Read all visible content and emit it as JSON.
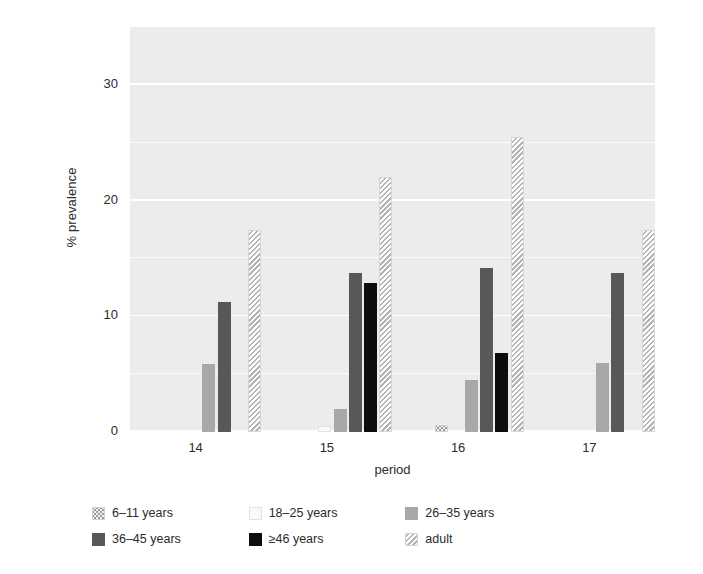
{
  "chart_data": {
    "type": "bar",
    "title": "",
    "xlabel": "period",
    "ylabel": "% prevalence",
    "categories": [
      "14",
      "15",
      "16",
      "17"
    ],
    "xtick_labels": [
      "14",
      "15",
      "16",
      "17"
    ],
    "ytick_labels": [
      "0",
      "10",
      "20",
      "30"
    ],
    "ytick_values": [
      0,
      10,
      20,
      30
    ],
    "yminor_values": [
      5,
      15,
      25
    ],
    "ylim": [
      0,
      35
    ],
    "grid": "horizontal-white-on-gray",
    "legend_position": "below-axis",
    "panel_background": "#ececec",
    "gridline_color": "#ffffff",
    "series": [
      {
        "name": "6–11 years",
        "fill": "dotted",
        "color": "#f2f2f2",
        "values": [
          0,
          0,
          0.6,
          0
        ]
      },
      {
        "name": "18–25 years",
        "fill": "very-light-solid",
        "color": "#fafafa",
        "values": [
          0,
          0.5,
          0,
          0
        ]
      },
      {
        "name": "26–35 years",
        "fill": "solid",
        "color": "#a8a8a8",
        "values": [
          5.9,
          2.0,
          4.5,
          6.0
        ]
      },
      {
        "name": "36–45 years",
        "fill": "solid",
        "color": "#585858",
        "values": [
          11.2,
          13.7,
          14.2,
          13.7
        ]
      },
      {
        "name": "≥46 years",
        "fill": "solid",
        "color": "#0d0d0d",
        "values": [
          0,
          12.9,
          6.8,
          0
        ]
      },
      {
        "name": "adult",
        "fill": "diagonal-hatch",
        "color": "#f4f4f4",
        "values": [
          17.5,
          22.0,
          25.5,
          17.5
        ]
      }
    ]
  },
  "legend": {
    "entries": [
      {
        "label": "6–11 years",
        "swatch": "dotted"
      },
      {
        "label": "18–25 years",
        "swatch": "very-light-solid"
      },
      {
        "label": "26–35 years",
        "swatch": "solid-mid"
      },
      {
        "label": "36–45 years",
        "swatch": "solid-dark"
      },
      {
        "label": "≥46 years",
        "swatch": "solid-black"
      },
      {
        "label": "adult",
        "swatch": "diagonal-hatch"
      }
    ]
  }
}
